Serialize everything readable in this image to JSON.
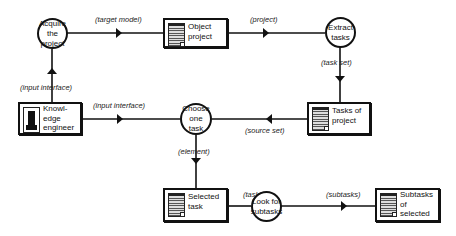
{
  "diagram": {
    "processes": [
      {
        "id": "acquire",
        "label": "Acquire the project"
      },
      {
        "id": "extract",
        "label": "Extract tasks"
      },
      {
        "id": "choose",
        "label": "Choose one task"
      },
      {
        "id": "lookfor",
        "label": "Look for subtasks"
      }
    ],
    "stores": [
      {
        "id": "object_project",
        "label": "Object project",
        "icon": "document-grid-icon"
      },
      {
        "id": "tasks_of_project",
        "label": "Tasks of project",
        "icon": "document-grid-icon"
      },
      {
        "id": "knowledge_engineer",
        "label": "Knowl-edge engineer",
        "line1": "Knowl-",
        "line2": "edge",
        "line3": "engineer",
        "icon": "person-icon"
      },
      {
        "id": "selected_task",
        "label": "Selected task",
        "icon": "document-grid-icon"
      },
      {
        "id": "subtasks_of_selected",
        "label": "Subtasks of selected",
        "icon": "document-grid-icon"
      }
    ],
    "flows": [
      {
        "from": "acquire",
        "to": "object_project",
        "label": "(target model)"
      },
      {
        "from": "object_project",
        "to": "extract",
        "label": "(project)"
      },
      {
        "from": "extract",
        "to": "tasks_of_project",
        "label": "(task set)"
      },
      {
        "from": "knowledge_engineer",
        "to": "acquire",
        "label": "(input interface)"
      },
      {
        "from": "knowledge_engineer",
        "to": "choose",
        "label": "(input interface)"
      },
      {
        "from": "tasks_of_project",
        "to": "choose",
        "label": "(source set)"
      },
      {
        "from": "choose",
        "to": "selected_task",
        "label": "(element)"
      },
      {
        "from": "selected_task",
        "to": "lookfor",
        "label": "(task)"
      },
      {
        "from": "lookfor",
        "to": "subtasks_of_selected",
        "label": "(subtasks)"
      }
    ]
  }
}
